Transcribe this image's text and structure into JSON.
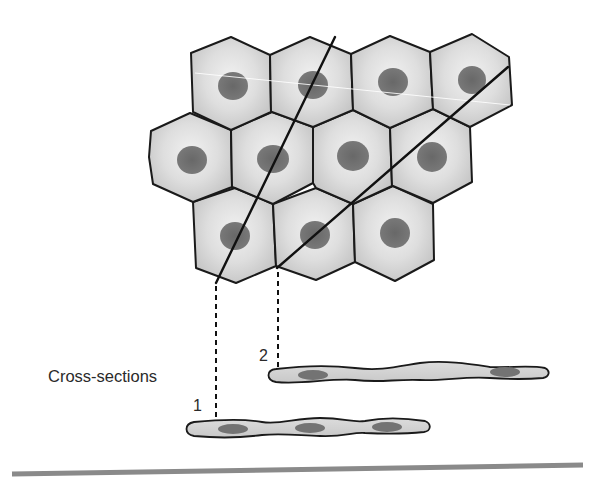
{
  "diagram": {
    "labels": {
      "cross_sections": "Cross-sections",
      "section_1": "1",
      "section_2": "2"
    },
    "colors": {
      "cell_fill_center": "#ececec",
      "cell_fill_edge": "#c6c6c6",
      "nucleus": "#6e6e6e",
      "outline": "#1a1a1a",
      "baseline": "#8a8a8a"
    },
    "cells": [
      {
        "row": 1,
        "cx": 233,
        "cy": 85
      },
      {
        "row": 1,
        "cx": 313,
        "cy": 85
      },
      {
        "row": 1,
        "cx": 393,
        "cy": 80
      },
      {
        "row": 1,
        "cx": 473,
        "cy": 80
      },
      {
        "row": 2,
        "cx": 193,
        "cy": 158
      },
      {
        "row": 2,
        "cx": 273,
        "cy": 158
      },
      {
        "row": 2,
        "cx": 353,
        "cy": 155
      },
      {
        "row": 2,
        "cx": 433,
        "cy": 158
      },
      {
        "row": 3,
        "cx": 235,
        "cy": 235
      },
      {
        "row": 3,
        "cx": 315,
        "cy": 235
      },
      {
        "row": 3,
        "cx": 395,
        "cy": 235
      }
    ],
    "cut_lines": [
      {
        "id": "1",
        "x1": 335,
        "y1": 37,
        "x2": 216,
        "y2": 283
      },
      {
        "id": "2",
        "x1": 508,
        "y1": 67,
        "x2": 277,
        "y2": 268
      }
    ],
    "cross_sections": [
      {
        "id": "1",
        "x_start": 187,
        "x_end": 430,
        "y": 427,
        "nuclei_x": [
          233,
          310,
          387
        ]
      },
      {
        "id": "2",
        "x_start": 268,
        "x_end": 548,
        "y": 373,
        "nuclei_x": [
          313,
          505
        ]
      }
    ]
  }
}
